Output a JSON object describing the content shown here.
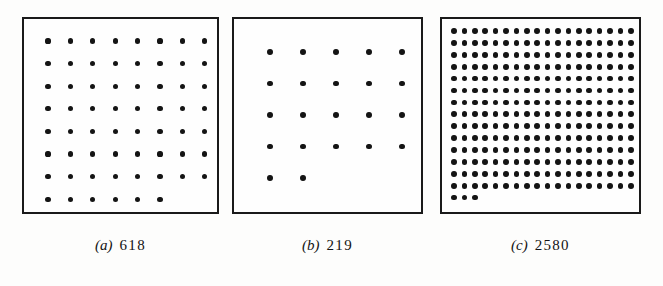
{
  "figure": {
    "background_color": "#fdfdfc",
    "ink_color": "#141414",
    "border_color": "#1a1a1a"
  },
  "panels": [
    {
      "id": "a",
      "caption_label": "(a)",
      "caption_count": "618",
      "frame": {
        "x": 22,
        "y": 17,
        "w": 197,
        "h": 197
      },
      "grid": {
        "cols": 8,
        "full_rows": 7,
        "last_row_dots": 6,
        "total_dots": 62,
        "dot_radius": 2.6,
        "x_start": 24,
        "y_start": 22,
        "x_step": 22.4,
        "y_step": 22.6
      }
    },
    {
      "id": "b",
      "caption_label": "(b)",
      "caption_count": "219",
      "frame": {
        "x": 232,
        "y": 17,
        "w": 191,
        "h": 197
      },
      "grid": {
        "cols": 5,
        "full_rows": 4,
        "last_row_dots": 2,
        "total_dots": 22,
        "dot_radius": 2.9,
        "x_start": 36,
        "y_start": 33,
        "x_step": 33.0,
        "y_step": 31.5
      }
    },
    {
      "id": "c",
      "caption_label": "(c)",
      "caption_count": "2580",
      "frame": {
        "x": 440,
        "y": 17,
        "w": 201,
        "h": 197
      },
      "grid": {
        "cols": 18,
        "full_rows": 14,
        "last_row_dots": 3,
        "total_dots": 255,
        "dot_radius": 2.9,
        "x_start": 12,
        "y_start": 12,
        "x_step": 10.4,
        "y_step": 11.9
      }
    }
  ],
  "chart_data": {
    "type": "scatter",
    "title": "",
    "xlabel": "",
    "ylabel": "",
    "series": [
      {
        "name": "(a) 618",
        "cols": 8,
        "rows": 8,
        "dots_drawn": 62,
        "labelled_value": 618
      },
      {
        "name": "(b) 219",
        "cols": 5,
        "rows": 5,
        "dots_drawn": 22,
        "labelled_value": 219
      },
      {
        "name": "(c) 2580",
        "cols": 18,
        "rows": 15,
        "dots_drawn": 255,
        "labelled_value": 2580
      }
    ],
    "categories": [
      "(a)",
      "(b)",
      "(c)"
    ],
    "values": [
      618,
      219,
      2580
    ]
  }
}
